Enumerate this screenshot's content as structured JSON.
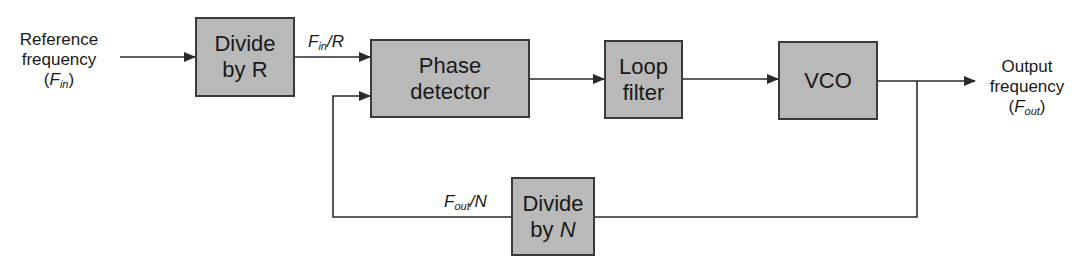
{
  "diagram": {
    "type": "PLL block diagram",
    "input": {
      "line1": "Reference",
      "line2": "frequency",
      "symbol": "F",
      "symbol_sub": "in"
    },
    "output": {
      "line1": "Output",
      "line2": "frequency",
      "symbol": "F",
      "symbol_sub": "out"
    },
    "blocks": {
      "divide_r": {
        "line1": "Divide",
        "line2": "by R"
      },
      "phase_detector": {
        "line1": "Phase",
        "line2": "detector"
      },
      "loop_filter": {
        "line1": "Loop",
        "line2": "filter"
      },
      "vco": {
        "line1": "VCO"
      },
      "divide_n": {
        "line1": "Divide",
        "line2_prefix": "by ",
        "line2_var": "N"
      }
    },
    "signals": {
      "fin_over_r": {
        "symbol": "F",
        "sub": "in",
        "suffix": "/R"
      },
      "fout_over_n": {
        "symbol": "F",
        "sub": "out",
        "suffix": "/N"
      }
    },
    "colors": {
      "block_fill": "#b9b9b9",
      "block_border": "#3a3a3a",
      "line": "#2a2a2a"
    }
  }
}
